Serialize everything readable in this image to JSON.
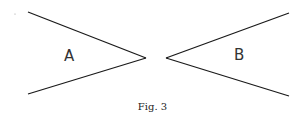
{
  "figure": {
    "caption": "Fig. 3",
    "shapes": [
      {
        "id": "A",
        "label": "A",
        "orientation": "opening-left",
        "description": "Two lines converging to a point on the right"
      },
      {
        "id": "B",
        "label": "B",
        "orientation": "opening-right",
        "description": "Two lines converging to a point on the left"
      }
    ],
    "colors": {
      "stroke": "#1a1a1a",
      "text": "#333333",
      "background": "#ffffff"
    }
  }
}
